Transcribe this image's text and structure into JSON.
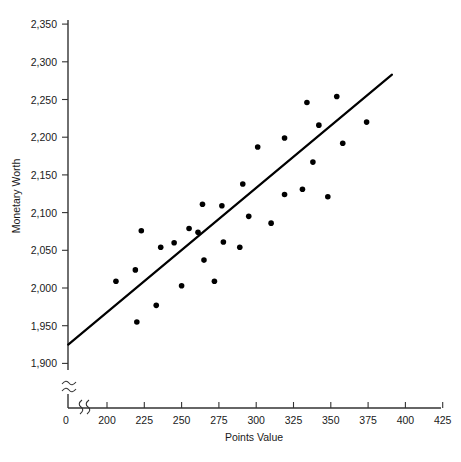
{
  "chart_data": {
    "type": "scatter",
    "title": "",
    "xlabel": "Points Value",
    "ylabel": "Monetary Worth",
    "xlim": [
      0,
      425
    ],
    "ylim": [
      1875,
      2350
    ],
    "grid": false,
    "legend": "none",
    "axis_break_x": true,
    "axis_break_y": true,
    "xticks": [
      0,
      200,
      225,
      250,
      275,
      300,
      325,
      350,
      375,
      400,
      425
    ],
    "xtick_labels": [
      "0",
      "200",
      "225",
      "250",
      "275",
      "300",
      "325",
      "350",
      "375",
      "400",
      "425"
    ],
    "yticks": [
      1900,
      1950,
      2000,
      2050,
      2100,
      2150,
      2200,
      2250,
      2300,
      2350
    ],
    "ytick_labels": [
      "1,900",
      "1,950",
      "2,000",
      "2,050",
      "2,100",
      "2,150",
      "2,200",
      "2,250",
      "2,300",
      "2,350"
    ],
    "x": [
      206,
      219,
      220,
      223,
      233,
      236,
      245,
      250,
      255,
      261,
      264,
      265,
      272,
      277,
      278,
      289,
      291,
      295,
      301,
      310,
      319,
      319,
      331,
      334,
      338,
      342,
      348,
      354,
      358,
      374
    ],
    "y": [
      2009,
      2024,
      1955,
      2076,
      1977,
      2054,
      2060,
      2003,
      2079,
      2074,
      2111,
      2037,
      2009,
      2109,
      2061,
      2054,
      2138,
      2095,
      2187,
      2086,
      2199,
      2124,
      2131,
      2246,
      2167,
      2216,
      2121,
      2254,
      2192,
      2220
    ],
    "points": [
      {
        "x": 206,
        "y": 2009
      },
      {
        "x": 219,
        "y": 2024
      },
      {
        "x": 220,
        "y": 1955
      },
      {
        "x": 223,
        "y": 2076
      },
      {
        "x": 233,
        "y": 1977
      },
      {
        "x": 236,
        "y": 2054
      },
      {
        "x": 245,
        "y": 2060
      },
      {
        "x": 250,
        "y": 2003
      },
      {
        "x": 255,
        "y": 2079
      },
      {
        "x": 261,
        "y": 2074
      },
      {
        "x": 264,
        "y": 2111
      },
      {
        "x": 265,
        "y": 2037
      },
      {
        "x": 272,
        "y": 2009
      },
      {
        "x": 277,
        "y": 2109
      },
      {
        "x": 278,
        "y": 2061
      },
      {
        "x": 289,
        "y": 2054
      },
      {
        "x": 291,
        "y": 2138
      },
      {
        "x": 295,
        "y": 2095
      },
      {
        "x": 301,
        "y": 2187
      },
      {
        "x": 310,
        "y": 2086
      },
      {
        "x": 319,
        "y": 2199
      },
      {
        "x": 319,
        "y": 2124
      },
      {
        "x": 331,
        "y": 2131
      },
      {
        "x": 334,
        "y": 2246
      },
      {
        "x": 338,
        "y": 2167
      },
      {
        "x": 342,
        "y": 2216
      },
      {
        "x": 348,
        "y": 2121
      },
      {
        "x": 354,
        "y": 2254
      },
      {
        "x": 358,
        "y": 2192
      },
      {
        "x": 374,
        "y": 2220
      }
    ],
    "trend_line": {
      "x0": 174,
      "y0": 1925,
      "x1": 391,
      "y1": 2283,
      "style": "solid",
      "color": "#000000"
    },
    "marker": {
      "shape": "circle",
      "color": "#000000",
      "size_px": 5
    }
  }
}
